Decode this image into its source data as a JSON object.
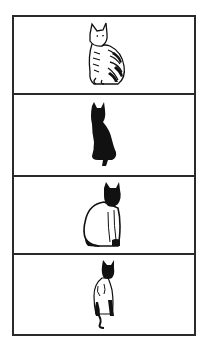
{
  "figure": {
    "panels": [
      {
        "label": "tabby-cat",
        "description": "Striped tabby cat sitting, line drawing"
      },
      {
        "label": "black-cat-silhouette",
        "description": "Solid black cat silhouette sitting"
      },
      {
        "label": "siamese-cat-sitting",
        "description": "White cat with dark face and paws sitting"
      },
      {
        "label": "siamese-cat-slim",
        "description": "Slim siamese-type cat sitting with dark points"
      }
    ],
    "colors": {
      "border": "#2a2a2a",
      "ink": "#111111",
      "background": "#ffffff"
    }
  }
}
